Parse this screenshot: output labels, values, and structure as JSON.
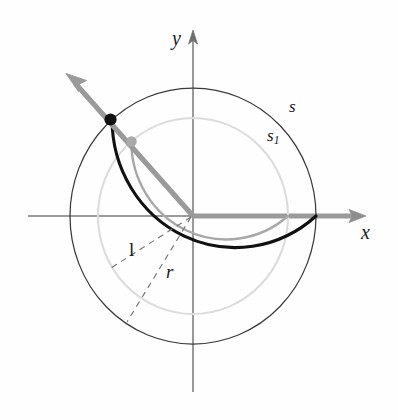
{
  "figure": {
    "background_color": "#fefefe",
    "axes": {
      "x_label": "x",
      "y_label": "y",
      "origin_px": [
        193,
        216
      ],
      "x_axis_color": "#8a8a8a",
      "y_axis_color": "#6e6e6e"
    },
    "labels": {
      "arc_outer": "s",
      "arc_inner_base": "s",
      "arc_inner_sub": "1",
      "segment_inner": "l",
      "segment_outer": "r"
    },
    "colors": {
      "outer_circle": "#2b2b2b",
      "outer_arc_highlight": "#111111",
      "inner_circle": "#d8d8d8",
      "inner_arc_highlight": "#a6a6a6",
      "ray": "#9a9a9a",
      "point_outer": "#111111",
      "point_inner": "#a8a8a8",
      "dashed": "#7d7d7d"
    },
    "geometry": {
      "outer_radius_x": 123,
      "outer_radius_y": 128,
      "inner_radius_x": 95,
      "inner_radius_y": 98,
      "ray_angle_deg": 130.5,
      "outer_arc_span_deg": [
        0,
        130.5
      ],
      "inner_arc_span_deg": [
        0,
        130.5
      ],
      "dashed_line_1_angle_deg": 211,
      "dashed_line_2_angle_deg": 238
    },
    "points": {
      "outer_point_px": [
        110,
        119
      ],
      "inner_point_px": [
        131,
        141
      ],
      "ray_arrow_tip_px": [
        68,
        76
      ]
    }
  }
}
